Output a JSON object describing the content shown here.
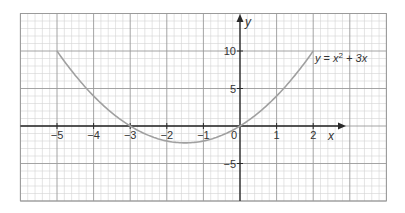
{
  "chart_data": {
    "type": "line",
    "title": "",
    "equation": "y = x² + 3x",
    "equation_parts": {
      "lhs": "y",
      "eq": " = ",
      "x": "x",
      "sup": "2",
      "rest": " + 3x"
    },
    "xlabel": "x",
    "ylabel": "y",
    "xlim": [
      -6,
      4
    ],
    "ylim": [
      -10,
      15
    ],
    "grid": true,
    "x_ticks": [
      -5,
      -4,
      -3,
      -2,
      -1,
      0,
      1,
      2
    ],
    "x_tick_labels": [
      "−5",
      "−4",
      "−3",
      "−2",
      "−1",
      "0",
      "1",
      "2"
    ],
    "y_ticks": [
      10,
      5,
      -5
    ],
    "y_tick_labels": [
      "10",
      "5",
      "−5"
    ],
    "series": [
      {
        "name": "y = x² + 3x",
        "x": [
          -5,
          -4.5,
          -4,
          -3.5,
          -3,
          -2.5,
          -2,
          -1.5,
          -1,
          -0.5,
          0,
          0.5,
          1,
          1.5,
          2
        ],
        "y": [
          10,
          6.75,
          4,
          1.75,
          0,
          -1.25,
          -2,
          -2.25,
          -2,
          -1.25,
          0,
          1.75,
          4,
          6.75,
          10
        ]
      }
    ],
    "domain": [
      -5,
      2
    ],
    "vertex": [
      -1.5,
      -2.25
    ],
    "roots": [
      -3,
      0
    ]
  },
  "colors": {
    "minor_grid": "#d4d4d4",
    "major_grid": "#9a9a9a",
    "axis": "#2a2a2a",
    "curve": "#a0a0a0",
    "text": "#333333",
    "background": "#ffffff"
  },
  "layout": {
    "origin_px": [
      240,
      126
    ],
    "x_scale": 36.6,
    "y_scale": 7.5,
    "plot_left": 21,
    "plot_right": 385,
    "plot_top": 13,
    "plot_bottom": 203,
    "x_arrow_tip": 346,
    "y_arrow_tip": 14
  }
}
